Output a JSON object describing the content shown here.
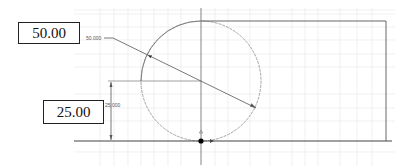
{
  "sketch": {
    "dimension_inputs": [
      {
        "name": "radius-input",
        "value": "50.00"
      },
      {
        "name": "height-input",
        "value": "25.00"
      }
    ],
    "dimension_labels": {
      "diameter": "50.000",
      "height": "25.000"
    },
    "colors": {
      "grid": "#e2e2e2",
      "geometry": "#555555",
      "construction_circle": "#9a9a9a",
      "origin_point": "#000000"
    }
  }
}
